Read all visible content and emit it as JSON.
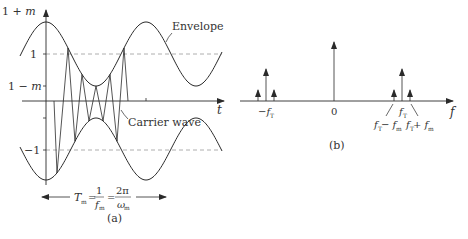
{
  "panel_a": {
    "caption": "(a)",
    "y_axis_labels": {
      "top": "1 + m",
      "one": "1",
      "one_minus_m": "1 − m",
      "minus_one": "−1"
    },
    "t_axis_label": "t",
    "envelope_label": "Envelope",
    "carrier_label": "Carrier wave",
    "period_formula": {
      "T": "T",
      "T_sub": "m",
      "eq1": "=",
      "frac1_num": "1",
      "frac1_den": "f",
      "frac1_den_sub": "m",
      "eq2": "=",
      "frac2_num": "2π",
      "frac2_den": "ω",
      "frac2_den_sub": "m"
    }
  },
  "panel_b": {
    "caption": "(b)",
    "f_axis_label": "f",
    "zero_label": "0",
    "neg_carrier_label": "−f",
    "neg_carrier_sub": "T",
    "carrier_label": "f",
    "carrier_sub": "T",
    "lower_sideband_label": [
      "f",
      "T",
      " − f",
      "m"
    ],
    "upper_sideband_label": [
      "f",
      "T",
      " + f",
      "m"
    ]
  },
  "colors": {
    "line": "#2a2a2a",
    "dashed": "#9a9a9a",
    "text": "#333333"
  }
}
